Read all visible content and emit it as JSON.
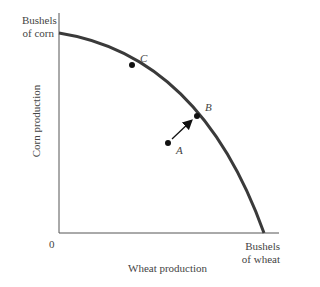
{
  "diagram": {
    "type": "production-possibilities-frontier",
    "y_axis": {
      "top_label_line1": "Bushels",
      "top_label_line2": "of corn",
      "title": "Corn production"
    },
    "x_axis": {
      "origin_label": "0",
      "end_label_line1": "Bushels",
      "end_label_line2": "of wheat",
      "title": "Wheat production"
    },
    "points": {
      "A": "A",
      "B": "B",
      "C": "C"
    },
    "colors": {
      "curve": "#3a3a3a",
      "axis": "#555555",
      "point": "#111111"
    }
  }
}
